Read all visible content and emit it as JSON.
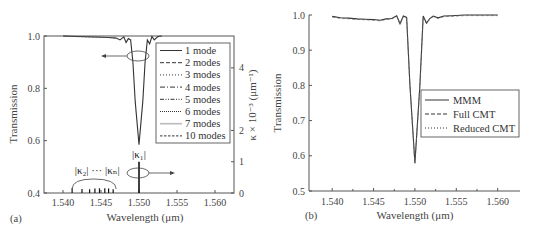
{
  "chart_data": [
    {
      "panel": "(a)",
      "type": "line",
      "xlabel": "Wavelength (μm)",
      "ylabel": "Transmission",
      "y2label": "κ × 10⁻³ (μm⁻¹)",
      "xlim": [
        1.5375,
        1.5625
      ],
      "ylim": [
        0.4,
        1.0
      ],
      "y2lim": [
        0,
        5.02
      ],
      "xticks": [
        "1.540",
        "1.545",
        "1.550",
        "1.555",
        "1.560"
      ],
      "xtick_values": [
        1.54,
        1.545,
        1.55,
        1.555,
        1.56
      ],
      "yticks": [
        "0.4",
        "0.6",
        "0.8",
        "1.0"
      ],
      "ytick_values": [
        0.4,
        0.6,
        0.8,
        1.0
      ],
      "y2ticks": [
        "0",
        "1",
        "2",
        "4"
      ],
      "y2tick_values": [
        0,
        1,
        2,
        4
      ],
      "grid": false,
      "legend_position": "upper right",
      "series": [
        {
          "name": "1 mode",
          "style": "solid"
        },
        {
          "name": "2 modes",
          "style": "dashed"
        },
        {
          "name": "3 modes",
          "style": "dotted"
        },
        {
          "name": "4 modes",
          "style": "dashdot"
        },
        {
          "name": "5 modes",
          "style": "dashdotdot"
        },
        {
          "name": "6 modes",
          "style": "shortdot"
        },
        {
          "name": "7 modes",
          "style": "light-solid"
        },
        {
          "name": "10 modes",
          "style": "shortdash"
        }
      ],
      "transmission_curve": {
        "x": [
          1.54,
          1.542,
          1.544,
          1.546,
          1.547,
          1.5475,
          1.548,
          1.5483,
          1.5486,
          1.5489,
          1.5492,
          1.5495,
          1.55,
          1.5505,
          1.5508,
          1.5511,
          1.5514,
          1.5517,
          1.552,
          1.5525,
          1.553
        ],
        "y": [
          1.0,
          0.998,
          0.996,
          0.994,
          0.992,
          0.985,
          0.997,
          0.975,
          0.99,
          0.985,
          0.9,
          0.75,
          0.585,
          0.75,
          0.9,
          0.985,
          0.97,
          0.998,
          0.985,
          0.998,
          1.0
        ]
      },
      "coupling_coefficients": {
        "kappa1": {
          "x": 1.55,
          "value": 1.0,
          "label": "|κ₁|"
        },
        "others": {
          "x": [
            1.5412,
            1.5425,
            1.5435,
            1.5442,
            1.5448,
            1.5455,
            1.546,
            1.5466
          ],
          "values": [
            0.15,
            0.13,
            0.12,
            0.14,
            0.15,
            0.15,
            0.14,
            0.12
          ],
          "label": "|κ₂| ... |κₙ|"
        }
      },
      "annotations": [
        "|κ₁|",
        "|κ₂| ... |κₙ|",
        "ellipse+arrow → left axis (transmission)",
        "ellipse+arrow → right axis (κ)"
      ]
    },
    {
      "panel": "(b)",
      "type": "line",
      "xlabel": "Wavelength (μm)",
      "ylabel": "Transmission",
      "xlim": [
        1.5372,
        1.5627
      ],
      "ylim": [
        0.5,
        1.0
      ],
      "xticks": [
        "1.540",
        "1.545",
        "1.550",
        "1.555",
        "1.560"
      ],
      "xtick_values": [
        1.54,
        1.545,
        1.55,
        1.555,
        1.56
      ],
      "yticks": [
        "0.5",
        "0.6",
        "0.7",
        "0.8",
        "0.9",
        "1.0"
      ],
      "ytick_values": [
        0.5,
        0.6,
        0.7,
        0.8,
        0.9,
        1.0
      ],
      "grid": false,
      "legend_position": "center right",
      "series": [
        {
          "name": "MMM",
          "style": "solid"
        },
        {
          "name": "Full CMT",
          "style": "dashed"
        },
        {
          "name": "Reduced CMT",
          "style": "dotted"
        }
      ],
      "transmission_curve": {
        "x": [
          1.54,
          1.541,
          1.542,
          1.543,
          1.544,
          1.545,
          1.5458,
          1.5465,
          1.5472,
          1.5478,
          1.5482,
          1.5486,
          1.549,
          1.5494,
          1.55,
          1.5506,
          1.551,
          1.5514,
          1.5518,
          1.5522,
          1.5528,
          1.5535,
          1.5545,
          1.556,
          1.56
        ],
        "y": [
          0.996,
          0.992,
          0.991,
          0.989,
          0.988,
          0.987,
          0.985,
          0.989,
          0.99,
          0.998,
          0.975,
          0.997,
          0.993,
          0.8,
          0.58,
          0.8,
          0.997,
          0.977,
          0.99,
          0.997,
          0.992,
          0.997,
          0.998,
          1.0,
          1.0
        ]
      }
    }
  ],
  "figure": {
    "panel_a_label": "(a)",
    "panel_b_label": "(b)",
    "kappa1_label": "|κ₁|",
    "kappa_n_label": "|κ₂| ··· |κₙ|"
  }
}
